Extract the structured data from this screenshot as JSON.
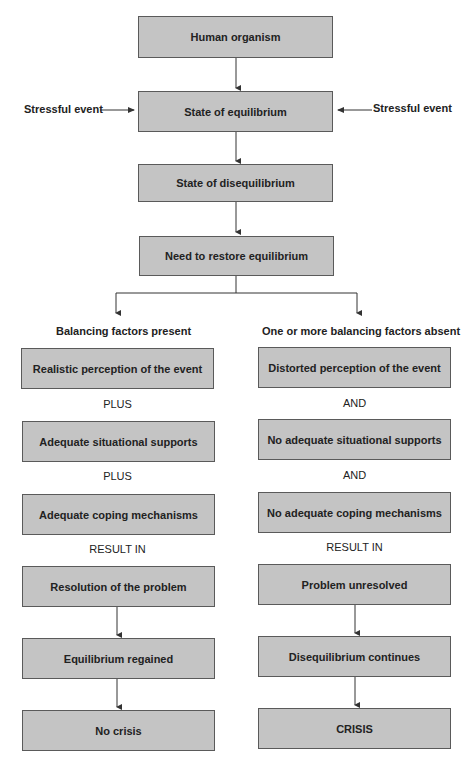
{
  "flow": {
    "human_organism": "Human organism",
    "state_equilibrium": "State of equilibrium",
    "state_disequilibrium": "State of disequilibrium",
    "need_restore": "Need to restore equilibrium",
    "stressful_event_left": "Stressful event",
    "stressful_event_right": "Stressful event"
  },
  "left_branch": {
    "heading": "Balancing factors present",
    "perception": "Realistic perception of the event",
    "connector1": "PLUS",
    "supports": "Adequate situational supports",
    "connector2": "PLUS",
    "coping": "Adequate coping mechanisms",
    "result_label": "RESULT IN",
    "resolution": "Resolution of the problem",
    "equilibrium": "Equilibrium regained",
    "outcome": "No crisis"
  },
  "right_branch": {
    "heading": "One or more balancing factors  absent",
    "perception": "Distorted perception of the event",
    "connector1": "AND",
    "supports": "No adequate situational supports",
    "connector2": "AND",
    "coping": "No adequate coping mechanisms",
    "result_label": "RESULT IN",
    "resolution": "Problem unresolved",
    "equilibrium": "Disequilibrium continues",
    "outcome": "CRISIS"
  },
  "colors": {
    "box_fill": "#c4c4c4",
    "box_border": "#5a5a5a",
    "line": "#333333"
  }
}
